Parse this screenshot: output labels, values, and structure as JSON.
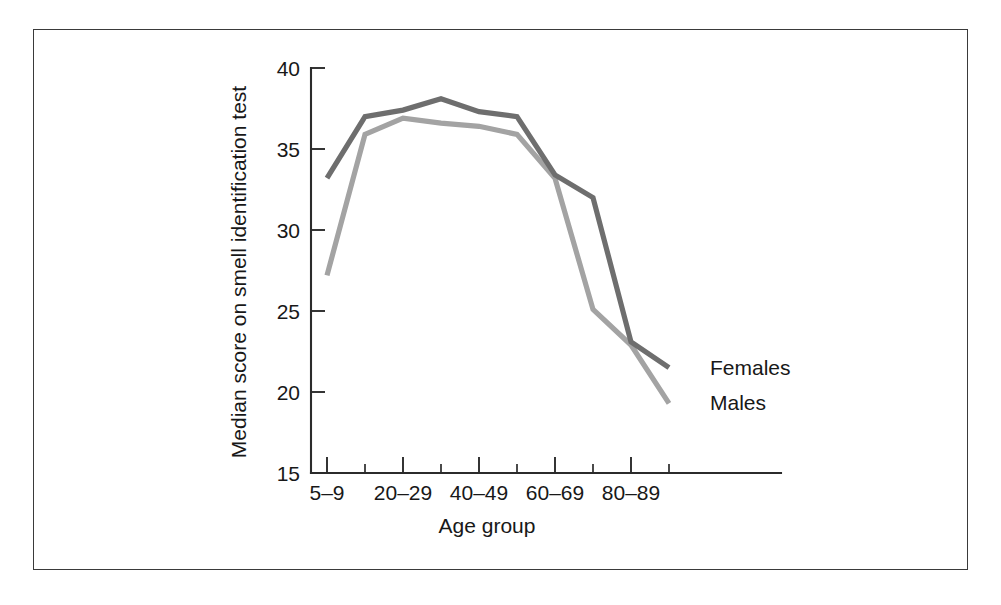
{
  "figure": {
    "background_color": "#ffffff",
    "frame_color": "#3a3a3a"
  },
  "chart_data": {
    "type": "line",
    "title": "",
    "xlabel": "Age group",
    "ylabel": "Median score on smell identification test",
    "categories": [
      "5–9",
      "10–19",
      "20–29",
      "30–39",
      "40–49",
      "50–59",
      "60–69",
      "70–79",
      "80–89",
      "90–99"
    ],
    "xtick_labels_shown": [
      "5–9",
      "20–29",
      "40–49",
      "60–69",
      "80–89"
    ],
    "ytick_labels": [
      "15",
      "20",
      "25",
      "30",
      "35",
      "40"
    ],
    "ylim": [
      15,
      40
    ],
    "xlim_categories": 10,
    "grid": false,
    "legend_position": "inline-right-end-of-line",
    "series": [
      {
        "name": "Females",
        "color": "#6e6e6e",
        "values": [
          33.2,
          37.0,
          37.4,
          38.1,
          37.3,
          37.0,
          33.4,
          32.0,
          23.1,
          21.5
        ]
      },
      {
        "name": "Males",
        "color": "#a3a3a3",
        "values": [
          27.2,
          35.9,
          36.9,
          36.6,
          36.4,
          35.9,
          33.2,
          25.1,
          22.9,
          19.3
        ]
      }
    ],
    "annotations": [
      {
        "text": "Females",
        "series": "Females"
      },
      {
        "text": "Males",
        "series": "Males"
      }
    ]
  }
}
